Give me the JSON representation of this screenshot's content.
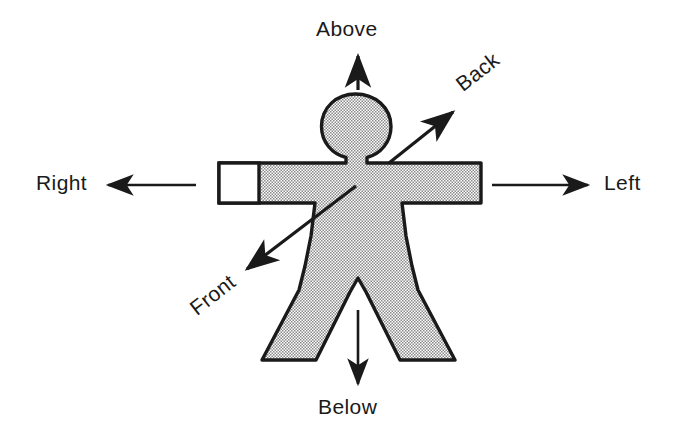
{
  "diagram": {
    "background_color": "#ffffff",
    "outline_color": "#1a1a1a",
    "fill_pattern": "stipple-halftone-gray",
    "fill_color": "#c8c8c8",
    "figure_name": "humanoid-body-outline"
  },
  "labels": {
    "above": "Above",
    "back": "Back",
    "left": "Left",
    "right": "Right",
    "front": "Front",
    "below": "Below"
  },
  "arrows": [
    {
      "name": "above-arrow",
      "label": "Above",
      "direction": "up",
      "from": [
        358,
        88
      ],
      "to": [
        358,
        52
      ]
    },
    {
      "name": "below-arrow",
      "label": "Below",
      "direction": "down",
      "from": [
        358,
        310
      ],
      "to": [
        358,
        388
      ]
    },
    {
      "name": "right-arrow",
      "label": "Right",
      "direction": "left",
      "from": [
        196,
        185
      ],
      "to": [
        104,
        185
      ]
    },
    {
      "name": "left-arrow",
      "label": "Left",
      "direction": "right",
      "from": [
        492,
        185
      ],
      "to": [
        592,
        185
      ]
    },
    {
      "name": "back-arrow",
      "label": "Back",
      "direction": "up-right",
      "from": [
        389,
        163
      ],
      "to": [
        457,
        108
      ]
    },
    {
      "name": "front-arrow",
      "label": "Front",
      "direction": "down-left",
      "from": [
        356,
        186
      ],
      "to": [
        242,
        273
      ]
    }
  ],
  "figure_parts": [
    "head",
    "neck",
    "left-arm",
    "right-arm",
    "right-hand-unfilled",
    "torso",
    "left-leg",
    "right-leg"
  ]
}
